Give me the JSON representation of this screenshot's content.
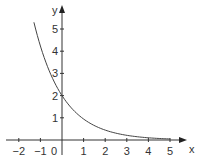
{
  "chart_data": {
    "type": "line",
    "title": "",
    "xlabel": "x",
    "ylabel": "y",
    "xlim": [
      -2.6,
      5.6
    ],
    "ylim": [
      -0.2,
      5.6
    ],
    "grid": false,
    "x_ticks": [
      -2,
      -1,
      0,
      1,
      2,
      3,
      4,
      5
    ],
    "x_tick_labels": [
      "−2",
      "−1",
      "0",
      "1",
      "2",
      "3",
      "4",
      "5"
    ],
    "y_ticks": [
      1,
      2,
      3,
      4,
      5
    ],
    "y_tick_labels": [
      "1",
      "2",
      "3",
      "4",
      "5"
    ],
    "series": [
      {
        "name": "y = 2e^(-0.75x)",
        "function": "2*exp(-0.75*x)",
        "x_range": [
          -1.3,
          5
        ],
        "x": [
          -1.3,
          -1,
          -0.5,
          0,
          0.5,
          1,
          1.5,
          2,
          2.5,
          3,
          3.5,
          4,
          4.5,
          5
        ],
        "values": [
          5.31,
          4.23,
          2.91,
          2.0,
          1.37,
          0.94,
          0.65,
          0.45,
          0.31,
          0.21,
          0.14,
          0.1,
          0.07,
          0.05
        ]
      }
    ],
    "colors": {
      "axis": "#333333",
      "curve": "#444444",
      "background": "#ffffff"
    }
  }
}
